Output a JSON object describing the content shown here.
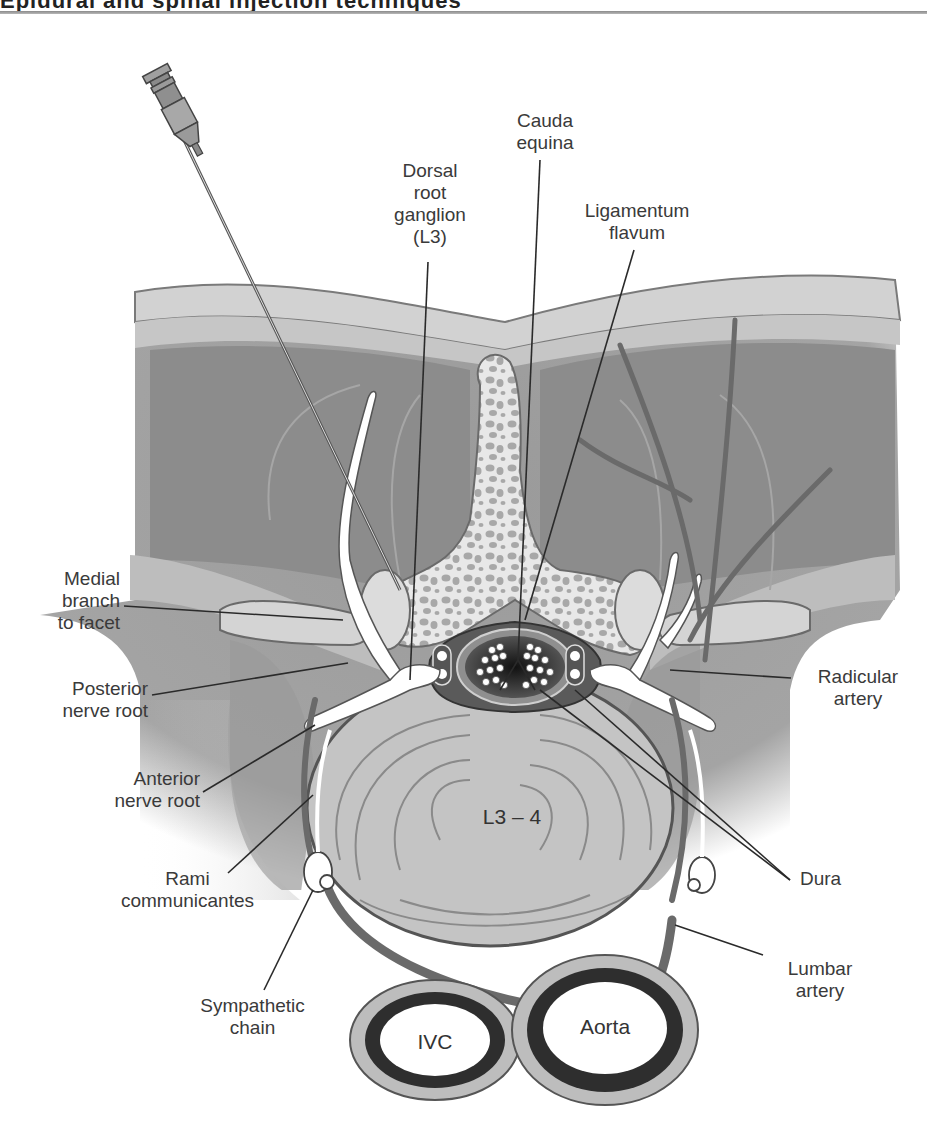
{
  "header": {
    "heading_fragment": "Epidural and spinal injection techniques",
    "rule_color": "#9a9a9a"
  },
  "diagram": {
    "disc_label": "L3 – 4",
    "vessel_labels": {
      "ivc": "IVC",
      "aorta": "Aorta"
    },
    "labels": {
      "cauda_equina": "Cauda\nequina",
      "dorsal_root_ganglion": "Dorsal\nroot\nganglion\n(L3)",
      "ligamentum_flavum": "Ligamentum\nflavum",
      "medial_branch": "Medial\nbranch\nto facet",
      "posterior_nerve_root": "Posterior\nnerve root",
      "anterior_nerve_root": "Anterior\nnerve root",
      "rami_communicantes": "Rami\ncommunicantes",
      "sympathetic_chain": "Sympathetic\nchain",
      "radicular_artery": "Radicular\nartery",
      "dura": "Dura",
      "lumbar_artery": "Lumbar\nartery"
    },
    "colors": {
      "skin": "#d6d6d6",
      "muscle": "#8f8f8f",
      "fascia": "#b9b9b9",
      "bone": "#e6e6e6",
      "bone_spots": "#a5a5a5",
      "disc": "#c4c4c4",
      "nerve": "#ffffff",
      "artery": "#6e6e6e",
      "csf_dark": "#2e2e2e",
      "line": "#2a2a2a",
      "text": "#3a3a3a"
    }
  }
}
